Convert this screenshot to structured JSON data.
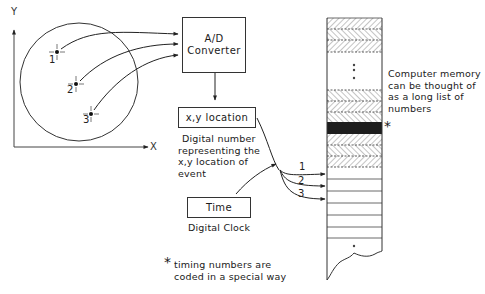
{
  "axes": {
    "x_label": "X",
    "y_label": "Y"
  },
  "events": [
    {
      "label": "1"
    },
    {
      "label": "2"
    },
    {
      "label": "3"
    }
  ],
  "boxes": {
    "ad_converter": {
      "line1": "A/D",
      "line2": "Converter"
    },
    "xy_location": {
      "label": "x,y location"
    },
    "time": {
      "label": "Time"
    }
  },
  "captions": {
    "xy_description": [
      "Digital number",
      "representing the",
      "x,y location of",
      "event"
    ],
    "clock": "Digital Clock",
    "footnote_marker": "*",
    "footnote": [
      "timing numbers are",
      "coded in a special way"
    ],
    "memory": [
      "Computer memory",
      "can be thought of",
      "as a long list of",
      "numbers"
    ],
    "memory_marker": "*"
  },
  "memory_arrows": [
    "1",
    "2",
    "3"
  ],
  "colors": {
    "line": "#333333",
    "hatch": "#777777",
    "timing_row": "#1e1e1e",
    "background": "#ffffff"
  }
}
